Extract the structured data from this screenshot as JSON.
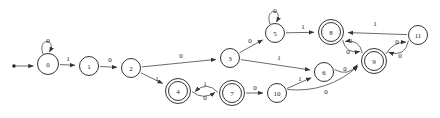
{
  "diagram": {
    "type": "finite-state-automaton",
    "title": "",
    "alphabet": [
      "0",
      "1"
    ],
    "start_state": "0",
    "accepting_states": [
      "4",
      "7",
      "8",
      "9"
    ],
    "colors": {
      "background": "#ffffff",
      "node_stroke": "#333333",
      "node_fill": "#ffffff",
      "edge_stroke": "#5a5a5a",
      "label_text": "#222222"
    },
    "start_marker": {
      "name": "start-dot",
      "x": 14,
      "y": 66
    },
    "states": [
      {
        "id": "0",
        "label": "0",
        "x": 48,
        "y": 64,
        "r": 10.5,
        "accepting": false
      },
      {
        "id": "1",
        "label": "1",
        "x": 89,
        "y": 66,
        "r": 9.5,
        "accepting": false
      },
      {
        "id": "2",
        "label": "2",
        "x": 131,
        "y": 68,
        "r": 9.5,
        "accepting": false
      },
      {
        "id": "3",
        "label": "3",
        "x": 230,
        "y": 58,
        "r": 9.5,
        "accepting": false
      },
      {
        "id": "4",
        "label": "4",
        "x": 178,
        "y": 91,
        "r": 9.5,
        "accepting": true
      },
      {
        "id": "5",
        "label": "5",
        "x": 275,
        "y": 33,
        "r": 9.5,
        "accepting": false
      },
      {
        "id": "6",
        "label": "6",
        "x": 324,
        "y": 72,
        "r": 9.5,
        "accepting": false
      },
      {
        "id": "7",
        "label": "7",
        "x": 232,
        "y": 93,
        "r": 9.5,
        "accepting": true
      },
      {
        "id": "8",
        "label": "8",
        "x": 331,
        "y": 32,
        "r": 9.5,
        "accepting": true
      },
      {
        "id": "9",
        "label": "9",
        "x": 374,
        "y": 61,
        "r": 9.5,
        "accepting": true
      },
      {
        "id": "10",
        "label": "10",
        "x": 277,
        "y": 93,
        "r": 9.5,
        "accepting": false
      },
      {
        "id": "11",
        "label": "11",
        "x": 418,
        "y": 35,
        "r": 9.5,
        "accepting": false
      }
    ],
    "transitions": [
      {
        "from": "0",
        "to": "0",
        "symbol": "0",
        "kind": "self",
        "label_x": 48,
        "label_y": 41
      },
      {
        "from": "0",
        "to": "1",
        "symbol": "1",
        "kind": "line",
        "label_x": 68,
        "label_y": 59
      },
      {
        "from": "1",
        "to": "2",
        "symbol": "0",
        "kind": "line",
        "label_x": 110,
        "label_y": 60
      },
      {
        "from": "2",
        "to": "3",
        "symbol": "0",
        "kind": "line",
        "label_x": 181,
        "label_y": 56
      },
      {
        "from": "2",
        "to": "4",
        "symbol": "1",
        "kind": "line",
        "label_x": 157,
        "label_y": 79
      },
      {
        "from": "3",
        "to": "5",
        "symbol": "0",
        "kind": "line",
        "label_x": 250,
        "label_y": 41
      },
      {
        "from": "3",
        "to": "6",
        "symbol": "1",
        "kind": "line",
        "label_x": 279,
        "label_y": 58
      },
      {
        "from": "4",
        "to": "7",
        "symbol": "0",
        "kind": "curve",
        "label_x": 205,
        "label_y": 98
      },
      {
        "from": "5",
        "to": "5",
        "symbol": "0",
        "kind": "self",
        "label_x": 275,
        "label_y": 11
      },
      {
        "from": "5",
        "to": "8",
        "symbol": "1",
        "kind": "line",
        "label_x": 303,
        "label_y": 27
      },
      {
        "from": "6",
        "to": "9",
        "symbol": "0",
        "kind": "curve",
        "label_x": 345,
        "label_y": 69
      },
      {
        "from": "7",
        "to": "4",
        "symbol": "1",
        "kind": "curve",
        "label_x": 205,
        "label_y": 84
      },
      {
        "from": "7",
        "to": "10",
        "symbol": "0",
        "kind": "line",
        "label_x": 255,
        "label_y": 88
      },
      {
        "from": "8",
        "to": "9",
        "symbol": "0",
        "kind": "curve",
        "label_x": 348,
        "label_y": 52
      },
      {
        "from": "9",
        "to": "8",
        "symbol": "1",
        "kind": "curve",
        "label_x": 351,
        "label_y": 41
      },
      {
        "from": "9",
        "to": "11",
        "symbol": "0",
        "kind": "curve",
        "label_x": 397,
        "label_y": 42
      },
      {
        "from": "10",
        "to": "6",
        "symbol": "1",
        "kind": "line",
        "label_x": 300,
        "label_y": 79
      },
      {
        "from": "10",
        "to": "9",
        "symbol": "0",
        "kind": "curve",
        "label_x": 326,
        "label_y": 92
      },
      {
        "from": "11",
        "to": "8",
        "symbol": "1",
        "kind": "line",
        "label_x": 375,
        "label_y": 24
      },
      {
        "from": "11",
        "to": "9",
        "symbol": "0",
        "kind": "curve",
        "label_x": 400,
        "label_y": 56
      }
    ]
  }
}
